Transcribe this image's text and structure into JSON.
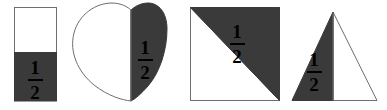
{
  "image": {
    "title": "Four shapes each divided in half with one half shaded and labeled one half",
    "width": 387,
    "height": 110,
    "background_color": "#ffffff",
    "shaded_color": "#3a3a3a",
    "outline_color": "#6e6e6e",
    "text_color": "#000000"
  },
  "fraction": {
    "numerator": "1",
    "denominator": "2",
    "label": "1/2"
  },
  "shapes": [
    {
      "name": "rectangle",
      "description": "Upright rectangle split horizontally; bottom half shaded",
      "shaded_part": "bottom half",
      "unshaded_part": "top half",
      "fraction_numerator": "1",
      "fraction_denominator": "2"
    },
    {
      "name": "heart",
      "description": "Heart split vertically; right half shaded",
      "shaded_part": "right half",
      "unshaded_part": "left half",
      "fraction_numerator": "1",
      "fraction_denominator": "2"
    },
    {
      "name": "square",
      "description": "Square split by a diagonal from bottom-left to top-right; upper-right triangle shaded",
      "shaded_part": "upper-right triangle",
      "unshaded_part": "lower-left triangle",
      "fraction_numerator": "1",
      "fraction_denominator": "2"
    },
    {
      "name": "triangle",
      "description": "Isosceles triangle split vertically through the apex; left half shaded",
      "shaded_part": "left half",
      "unshaded_part": "right half",
      "fraction_numerator": "1",
      "fraction_denominator": "2"
    }
  ]
}
